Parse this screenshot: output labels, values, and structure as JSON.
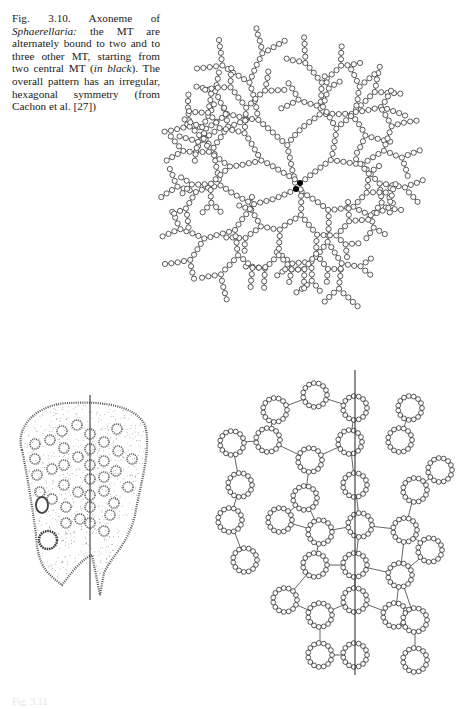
{
  "figure_3_10": {
    "caption_parts": {
      "label": "Fig. 3.10. Axoneme of ",
      "genus": "Sphaerellaria:",
      "text1": " the MT are alternately bound to two and to three other MT, starting from two central MT (",
      "emph": "in black",
      "text2": "). The overall pattern has an irregular, hexagonal symmetry (from Cachon et al. [27])"
    },
    "diagram": {
      "type": "branching-tree",
      "description": "Microtubules (open circles) linked in branching chains radiating from two central MT (filled black)",
      "central_mt_color": "#000000",
      "mt_stroke": "#333333",
      "arms": 6
    }
  },
  "figure_lower": {
    "left_panel": {
      "type": "stippled-cell-section",
      "description": "Cross-section of axopod with circular MT profiles, divided by vertical line"
    },
    "right_panel": {
      "type": "hexagonal-ring-lattice",
      "description": "Rings of microtubules arranged in hexagonal lattice, divided by vertical line"
    }
  },
  "bottom_caption": {
    "text": "Fig. 3.11"
  }
}
